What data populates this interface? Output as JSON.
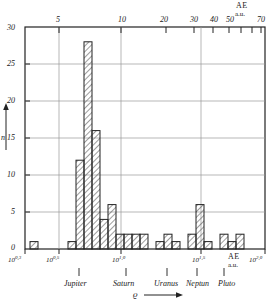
{
  "figure": {
    "axis_top_label_line1": "AE",
    "axis_top_label_line2": "a.u.",
    "axis_bottom_label_line1": "AE",
    "axis_bottom_label_line2": "a.u.",
    "y_axis_symbol": "n",
    "x_axis_symbol": "ϱ"
  },
  "top_axis": {
    "ticks": [
      "5",
      "10",
      "20",
      "30",
      "40",
      "50",
      "70"
    ]
  },
  "y_axis": {
    "ticks": [
      "0",
      "5",
      "10",
      "15",
      "20",
      "25",
      "30"
    ]
  },
  "bottom_axis": {
    "ticks": [
      {
        "base": "10",
        "exp": "0,3"
      },
      {
        "base": "10",
        "exp": "0,5"
      },
      {
        "base": "10",
        "exp": "1,0"
      },
      {
        "base": "10",
        "exp": "1,5"
      },
      {
        "base": "10",
        "exp": "2,0"
      }
    ]
  },
  "planets": [
    "Jupiter",
    "Saturn",
    "Uranus",
    "Neptun",
    "Pluto"
  ],
  "chart_data": {
    "type": "bar",
    "title": "",
    "xlabel": "ϱ",
    "ylabel": "n",
    "ylim": [
      0,
      30
    ],
    "ytick_step": 5,
    "grid": true,
    "x_axis_scale": "log",
    "x_axis_unit": "AE (a.u.)",
    "x_top_ticks": [
      5,
      10,
      20,
      30,
      40,
      50,
      70
    ],
    "x_bottom_ticks": [
      "10^0,3",
      "10^0,5",
      "10^1,0",
      "10^1,5",
      "10^2,0"
    ],
    "planet_markers": [
      "Jupiter",
      "Saturn",
      "Uranus",
      "Neptun",
      "Pluto"
    ],
    "bars": [
      {
        "x0": 30,
        "x1": 38,
        "value": 1
      },
      {
        "x0": 68,
        "x1": 76,
        "value": 1
      },
      {
        "x0": 76,
        "x1": 84,
        "value": 12
      },
      {
        "x0": 84,
        "x1": 92,
        "value": 28
      },
      {
        "x0": 92,
        "x1": 100,
        "value": 16
      },
      {
        "x0": 100,
        "x1": 108,
        "value": 4
      },
      {
        "x0": 108,
        "x1": 116,
        "value": 6
      },
      {
        "x0": 116,
        "x1": 124,
        "value": 2
      },
      {
        "x0": 124,
        "x1": 132,
        "value": 2
      },
      {
        "x0": 132,
        "x1": 140,
        "value": 2
      },
      {
        "x0": 140,
        "x1": 148,
        "value": 2
      },
      {
        "x0": 156,
        "x1": 164,
        "value": 1
      },
      {
        "x0": 164,
        "x1": 172,
        "value": 2
      },
      {
        "x0": 172,
        "x1": 180,
        "value": 1
      },
      {
        "x0": 188,
        "x1": 196,
        "value": 2
      },
      {
        "x0": 196,
        "x1": 204,
        "value": 6
      },
      {
        "x0": 204,
        "x1": 212,
        "value": 1
      },
      {
        "x0": 220,
        "x1": 228,
        "value": 2
      },
      {
        "x0": 228,
        "x1": 236,
        "value": 1
      },
      {
        "x0": 236,
        "x1": 244,
        "value": 2
      }
    ]
  }
}
